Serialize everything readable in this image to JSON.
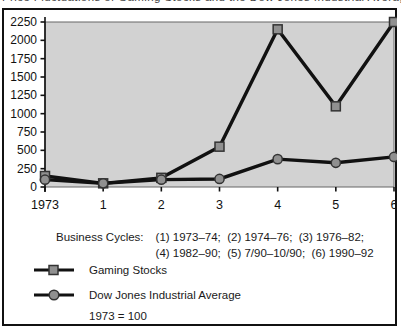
{
  "clipped_title": "Price Fluctuations of Gaming Stocks and the Dow Jones Industrial Average",
  "figure": {
    "caption_label": "Business Cycles:",
    "caption_line1": "(1) 1973–74;  (2) 1974–76;  (3) 1976–82;",
    "caption_line2": "(4) 1982–90;  (5) 7/90–10/90;  (6) 1990–92",
    "legend": [
      {
        "label": "Gaming Stocks",
        "marker": "square"
      },
      {
        "label": "Dow Jones Industrial Average",
        "marker": "circle"
      }
    ],
    "baseline_note": "1973 = 100"
  },
  "chart_data": {
    "type": "line",
    "title": "",
    "xlabel": "",
    "ylabel": "",
    "x_labels": [
      "1973",
      "1",
      "2",
      "3",
      "4",
      "5",
      "6"
    ],
    "series": [
      {
        "name": "Gaming Stocks",
        "marker": "square",
        "values": [
          150,
          50,
          125,
          550,
          2150,
          1100,
          2250
        ]
      },
      {
        "name": "Dow Jones Industrial Average",
        "marker": "circle",
        "values": [
          100,
          50,
          100,
          110,
          380,
          330,
          410
        ]
      }
    ],
    "ylim": [
      0,
      2250
    ],
    "ytick_step": 250,
    "grid": false,
    "legend_position": "below",
    "plot_bg": "#d2d2d2",
    "plot_border": "#666666",
    "axis_color": "#111111",
    "line_color": "#111111",
    "marker_fill": "#909090",
    "marker_stroke": "#333333"
  }
}
